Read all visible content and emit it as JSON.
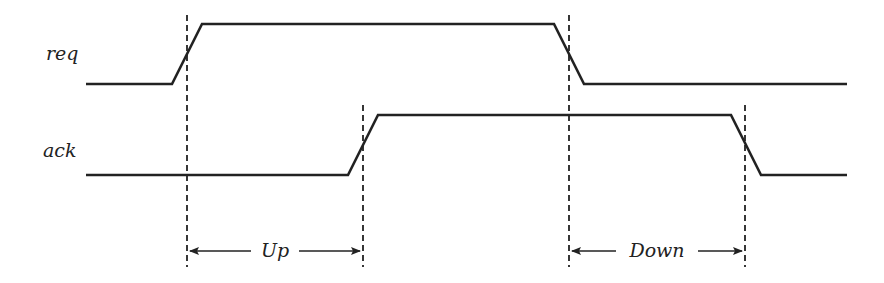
{
  "signals": [
    {
      "name": "req",
      "label_pos": [
        46,
        60
      ],
      "points": [
        [
          86,
          84
        ],
        [
          172,
          84
        ],
        [
          202,
          24
        ],
        [
          554,
          24
        ],
        [
          584,
          84
        ],
        [
          847,
          84
        ]
      ]
    },
    {
      "name": "ack",
      "label_pos": [
        43,
        157
      ],
      "points": [
        [
          86,
          175
        ],
        [
          348,
          175
        ],
        [
          378,
          115
        ],
        [
          731,
          115
        ],
        [
          761,
          175
        ],
        [
          847,
          175
        ]
      ]
    }
  ],
  "markers": [
    {
      "name": "req-rise",
      "x": 187,
      "y1": 15,
      "y2": 267
    },
    {
      "name": "ack-rise",
      "x": 363,
      "y1": 105,
      "y2": 267
    },
    {
      "name": "req-fall",
      "x": 569,
      "y1": 15,
      "y2": 267
    },
    {
      "name": "ack-fall",
      "x": 745,
      "y1": 105,
      "y2": 267
    }
  ],
  "intervals": [
    {
      "label": "Up",
      "x1": 190,
      "x2": 360,
      "y": 251,
      "text_x": 275,
      "gap_left": 251,
      "gap_right": 299
    },
    {
      "label": "Down",
      "x1": 572,
      "x2": 742,
      "y": 251,
      "text_x": 657,
      "gap_left": 616,
      "gap_right": 698
    }
  ]
}
